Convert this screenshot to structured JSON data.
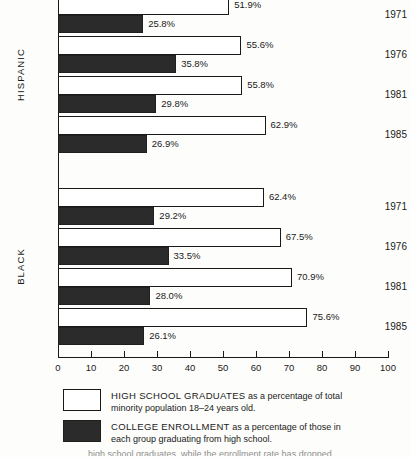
{
  "chart_data": {
    "type": "bar",
    "orientation": "horizontal",
    "title": "",
    "xlabel": "",
    "ylabel": "",
    "xlim": [
      0,
      100
    ],
    "xticks": [
      0,
      10,
      20,
      30,
      40,
      50,
      60,
      70,
      80,
      90,
      100
    ],
    "xtick_labels": [
      "0",
      "10",
      "20",
      "30",
      "40",
      "50",
      "60",
      "70",
      "80",
      "90",
      "100"
    ],
    "grid": false,
    "legend_position": "bottom",
    "value_suffix": "%",
    "series": [
      {
        "name": "HIGH SCHOOL GRADUATES",
        "style": "light",
        "color": "#ffffff"
      },
      {
        "name": "COLLEGE ENROLLMENT",
        "style": "dark",
        "color": "#2b2b2b"
      }
    ],
    "groups": [
      {
        "name": "HISPANIC",
        "categories": [
          "1971",
          "1976",
          "1981",
          "1985"
        ],
        "values": {
          "HIGH SCHOOL GRADUATES": [
            51.9,
            55.6,
            55.8,
            62.9
          ],
          "COLLEGE ENROLLMENT": [
            25.8,
            35.8,
            29.8,
            26.9
          ]
        },
        "labels": {
          "HIGH SCHOOL GRADUATES": [
            "51.9%",
            "55.6%",
            "55.8%",
            "62.9%"
          ],
          "COLLEGE ENROLLMENT": [
            "25.8%",
            "35.8%",
            "29.8%",
            "26.9%"
          ]
        }
      },
      {
        "name": "BLACK",
        "categories": [
          "1971",
          "1976",
          "1981",
          "1985"
        ],
        "values": {
          "HIGH SCHOOL GRADUATES": [
            62.4,
            67.5,
            70.9,
            75.6
          ],
          "COLLEGE ENROLLMENT": [
            29.2,
            33.5,
            28.0,
            26.1
          ]
        },
        "labels": {
          "HIGH SCHOOL GRADUATES": [
            "62.4%",
            "67.5%",
            "70.9%",
            "75.6%"
          ],
          "COLLEGE ENROLLMENT": [
            "29.2%",
            "33.5%",
            "28.0%",
            "26.1%"
          ]
        }
      }
    ]
  },
  "groups": [
    {
      "label": "HISPANIC",
      "rows": [
        {
          "year": "1971",
          "light": 51.9,
          "light_label": "51.9%",
          "dark": 25.8,
          "dark_label": "25.8%"
        },
        {
          "year": "1976",
          "light": 55.6,
          "light_label": "55.6%",
          "dark": 35.8,
          "dark_label": "35.8%"
        },
        {
          "year": "1981",
          "light": 55.8,
          "light_label": "55.8%",
          "dark": 29.8,
          "dark_label": "29.8%"
        },
        {
          "year": "1985",
          "light": 62.9,
          "light_label": "62.9%",
          "dark": 26.9,
          "dark_label": "26.9%"
        }
      ]
    },
    {
      "label": "BLACK",
      "rows": [
        {
          "year": "1971",
          "light": 62.4,
          "light_label": "62.4%",
          "dark": 29.2,
          "dark_label": "29.2%"
        },
        {
          "year": "1976",
          "light": 67.5,
          "light_label": "67.5%",
          "dark": 33.5,
          "dark_label": "33.5%"
        },
        {
          "year": "1981",
          "light": 70.9,
          "light_label": "70.9%",
          "dark": 28.0,
          "dark_label": "28.0%"
        },
        {
          "year": "1985",
          "light": 75.6,
          "light_label": "75.6%",
          "dark": 26.1,
          "dark_label": "26.1%"
        }
      ]
    }
  ],
  "axis": {
    "ticks": [
      "0",
      "10",
      "20",
      "30",
      "40",
      "50",
      "60",
      "70",
      "80",
      "90",
      "100"
    ]
  },
  "legend": {
    "items": [
      {
        "swatch": "light",
        "title": "HIGH SCHOOL GRADUATES",
        "rest": " as a percentage of total",
        "line2": "minority population 18–24 years old."
      },
      {
        "swatch": "dark",
        "title": "COLLEGE ENROLLMENT",
        "rest": " as a percentage of those in",
        "line2": "each group graduating from high school."
      }
    ],
    "cut_off_line": "high school graduates, while the enrollment rate has dropped."
  }
}
